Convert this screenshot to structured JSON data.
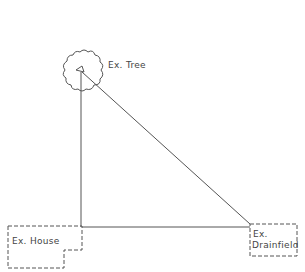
{
  "diagram": {
    "type": "site-plan",
    "colors": {
      "line": "#555555",
      "background": "#ffffff"
    },
    "elements": {
      "tree": {
        "label": "Ex. Tree"
      },
      "house": {
        "label": "Ex. House"
      },
      "drainfield": {
        "label_line1": "Ex.",
        "label_line2": "Drainfield"
      }
    },
    "connections": [
      {
        "from": "tree",
        "to": "house"
      },
      {
        "from": "tree",
        "to": "drainfield"
      },
      {
        "from": "house",
        "to": "drainfield"
      }
    ]
  }
}
